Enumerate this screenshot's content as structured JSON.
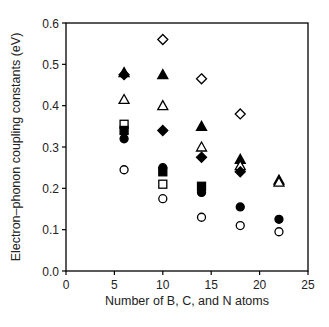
{
  "chart_data": {
    "type": "scatter",
    "title": "",
    "xlabel": "Number of B, C, and N atoms",
    "ylabel": "Electron–phonon coupling constants (eV)",
    "xlim": [
      0,
      25
    ],
    "ylim": [
      0.0,
      0.6
    ],
    "xticks": [
      0,
      5,
      10,
      15,
      20,
      25
    ],
    "xtick_labels": [
      "0",
      "5",
      "10",
      "15",
      "20",
      "25"
    ],
    "yticks": [
      0.0,
      0.1,
      0.2,
      0.3,
      0.4,
      0.5,
      0.6
    ],
    "ytick_labels": [
      "0.0",
      "0.1",
      "0.2",
      "0.3",
      "0.4",
      "0.5",
      "0.6"
    ],
    "grid": false,
    "legend": null,
    "series": [
      {
        "name": "open-diamond",
        "marker": "diamond",
        "filled": false,
        "points": [
          [
            10,
            0.56
          ],
          [
            14,
            0.465
          ],
          [
            18,
            0.38
          ]
        ]
      },
      {
        "name": "filled-triangle",
        "marker": "triangle",
        "filled": true,
        "points": [
          [
            6,
            0.48
          ],
          [
            10,
            0.475
          ],
          [
            14,
            0.35
          ],
          [
            18,
            0.27
          ],
          [
            22,
            0.22
          ]
        ]
      },
      {
        "name": "open-triangle",
        "marker": "triangle",
        "filled": false,
        "points": [
          [
            6,
            0.415
          ],
          [
            10,
            0.4
          ],
          [
            14,
            0.3
          ],
          [
            18,
            0.255
          ],
          [
            22,
            0.215
          ]
        ]
      },
      {
        "name": "filled-diamond",
        "marker": "diamond",
        "filled": true,
        "points": [
          [
            6,
            0.475
          ],
          [
            10,
            0.34
          ],
          [
            14,
            0.275
          ],
          [
            18,
            0.24
          ]
        ]
      },
      {
        "name": "open-square",
        "marker": "square",
        "filled": false,
        "points": [
          [
            6,
            0.355
          ],
          [
            10,
            0.21
          ]
        ]
      },
      {
        "name": "filled-square",
        "marker": "square",
        "filled": true,
        "points": [
          [
            6,
            0.34
          ],
          [
            10,
            0.24
          ],
          [
            14,
            0.205
          ]
        ]
      },
      {
        "name": "filled-circle",
        "marker": "circle",
        "filled": true,
        "points": [
          [
            6,
            0.32
          ],
          [
            10,
            0.25
          ],
          [
            14,
            0.19
          ],
          [
            18,
            0.155
          ],
          [
            22,
            0.125
          ]
        ]
      },
      {
        "name": "open-circle",
        "marker": "circle",
        "filled": false,
        "points": [
          [
            6,
            0.245
          ],
          [
            10,
            0.175
          ],
          [
            14,
            0.13
          ],
          [
            18,
            0.11
          ],
          [
            22,
            0.095
          ]
        ]
      }
    ]
  },
  "layout": {
    "plot_left": 66,
    "plot_top": 23,
    "plot_right": 308,
    "plot_bottom": 271,
    "marker_color": "#000000",
    "axis_color": "#000000"
  }
}
